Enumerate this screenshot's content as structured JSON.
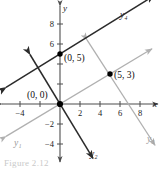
{
  "figure": {
    "caption": "Figure 2.12",
    "colors": {
      "axis": "#4d4d4d",
      "dark_line": "#2b2b2b",
      "light_line": "#b0b0b0",
      "point": "#000000",
      "text": "#1a1a1a",
      "background": "#ffffff"
    },
    "axes": {
      "x_label": "x",
      "y_label": "y",
      "origin_px": {
        "x": 60,
        "y": 104
      },
      "px_per_unit": 10,
      "xlim": [
        -5.8,
        9.8
      ],
      "ylim": [
        -5.8,
        9.8
      ],
      "x_ticks": [
        {
          "value": -4,
          "label": "−4"
        },
        {
          "value": -2,
          "label": ""
        },
        {
          "value": 2,
          "label": "2"
        },
        {
          "value": 4,
          "label": "4"
        },
        {
          "value": 6,
          "label": "6"
        },
        {
          "value": 8,
          "label": "8"
        }
      ],
      "y_ticks": [
        {
          "value": 8,
          "label": "8"
        },
        {
          "value": 6,
          "label": "6"
        },
        {
          "value": 4,
          "label": ""
        },
        {
          "value": 2,
          "label": ""
        },
        {
          "value": -2,
          "label": "−2"
        },
        {
          "value": -4,
          "label": "−4"
        }
      ]
    },
    "points": [
      {
        "name": "point-0-5",
        "label": "(0, 5)",
        "x": 0,
        "y": 5,
        "label_dx": 4,
        "label_dy": 7
      },
      {
        "name": "point-5-3",
        "label": "(5, 3)",
        "x": 5,
        "y": 3,
        "label_dx": 4,
        "label_dy": 4
      },
      {
        "name": "point-origin",
        "label": "(0, 0)",
        "x": 0,
        "y": 0,
        "label_dx": -33,
        "label_dy": -6
      }
    ],
    "lines": [
      {
        "name": "line-y1",
        "label": "y₁",
        "style": "light",
        "slope": 0.6,
        "intercept": 0,
        "x_from": -5.4,
        "x_to": 9.2,
        "arrow_start": true,
        "arrow_end": true,
        "label_px": {
          "x": 14,
          "y": 146
        }
      },
      {
        "name": "line-y2",
        "label": "y₂",
        "style": "dark",
        "slope": -1.65,
        "intercept": 0,
        "x_from": -3.0,
        "x_to": 3.3,
        "arrow_start": true,
        "arrow_end": true,
        "label_px": {
          "x": 90,
          "y": 157
        }
      },
      {
        "name": "line-y3",
        "label": "y₃",
        "style": "light",
        "slope": -1.55,
        "intercept": 10.6,
        "x_from": 2.7,
        "x_to": 9.5,
        "arrow_start": true,
        "arrow_end": true,
        "label_px": {
          "x": 147,
          "y": 142
        }
      },
      {
        "name": "line-y4",
        "label": "y₄",
        "style": "dark",
        "slope": 0.62,
        "intercept": 5,
        "x_from": -5.4,
        "x_to": 9.4,
        "arrow_start": true,
        "arrow_end": true,
        "label_px": {
          "x": 120,
          "y": 18
        }
      }
    ]
  }
}
